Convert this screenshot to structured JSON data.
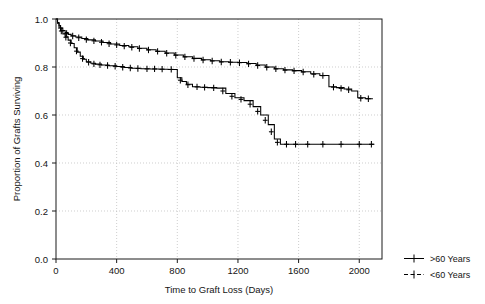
{
  "chart_data": {
    "type": "line",
    "title": "",
    "xlabel": "Time to Graft Loss (Days)",
    "ylabel": "Proportion of Grafts Surviving",
    "xlim": [
      0,
      2150
    ],
    "ylim": [
      0.0,
      1.0
    ],
    "xticks": [
      0,
      400,
      800,
      1200,
      1600,
      2000
    ],
    "xticklabels": [
      "0",
      "400",
      "800",
      "1200",
      "1600",
      "2000"
    ],
    "yticks": [
      0.0,
      0.2,
      0.4,
      0.6,
      0.8,
      1.0
    ],
    "yticklabels": [
      "0.0",
      "0.2",
      "0.4",
      "0.6",
      "0.8",
      "1.0"
    ],
    "grid": true,
    "legend_position": "right-outside",
    "style": "kaplan-meier step plot with plus-sign censoring marks",
    "series": [
      {
        "name": ">60 Years",
        "marker": "plus",
        "color": "#000000",
        "points": [
          [
            0,
            1.0
          ],
          [
            10,
            0.985
          ],
          [
            20,
            0.972
          ],
          [
            30,
            0.962
          ],
          [
            45,
            0.952
          ],
          [
            60,
            0.944
          ],
          [
            80,
            0.936
          ],
          [
            100,
            0.93
          ],
          [
            130,
            0.925
          ],
          [
            170,
            0.919
          ],
          [
            210,
            0.913
          ],
          [
            260,
            0.908
          ],
          [
            310,
            0.902
          ],
          [
            360,
            0.896
          ],
          [
            420,
            0.89
          ],
          [
            480,
            0.884
          ],
          [
            540,
            0.878
          ],
          [
            600,
            0.872
          ],
          [
            660,
            0.866
          ],
          [
            720,
            0.858
          ],
          [
            780,
            0.85
          ],
          [
            840,
            0.843
          ],
          [
            900,
            0.836
          ],
          [
            960,
            0.83
          ],
          [
            1020,
            0.826
          ],
          [
            1080,
            0.822
          ],
          [
            1140,
            0.82
          ],
          [
            1200,
            0.819
          ],
          [
            1260,
            0.815
          ],
          [
            1320,
            0.808
          ],
          [
            1380,
            0.8
          ],
          [
            1440,
            0.793
          ],
          [
            1500,
            0.788
          ],
          [
            1560,
            0.785
          ],
          [
            1620,
            0.78
          ],
          [
            1680,
            0.772
          ],
          [
            1740,
            0.765
          ],
          [
            1800,
            0.718
          ],
          [
            1850,
            0.714
          ],
          [
            1900,
            0.708
          ],
          [
            1950,
            0.7
          ],
          [
            1990,
            0.672
          ],
          [
            2040,
            0.668
          ],
          [
            2090,
            0.668
          ]
        ],
        "censor_marks": [
          [
            30,
            0.962
          ],
          [
            70,
            0.94
          ],
          [
            110,
            0.929
          ],
          [
            150,
            0.922
          ],
          [
            200,
            0.914
          ],
          [
            250,
            0.909
          ],
          [
            300,
            0.903
          ],
          [
            350,
            0.897
          ],
          [
            400,
            0.892
          ],
          [
            450,
            0.887
          ],
          [
            500,
            0.882
          ],
          [
            550,
            0.877
          ],
          [
            610,
            0.871
          ],
          [
            670,
            0.865
          ],
          [
            730,
            0.857
          ],
          [
            790,
            0.849
          ],
          [
            850,
            0.842
          ],
          [
            910,
            0.835
          ],
          [
            970,
            0.829
          ],
          [
            1030,
            0.825
          ],
          [
            1090,
            0.821
          ],
          [
            1150,
            0.82
          ],
          [
            1210,
            0.818
          ],
          [
            1270,
            0.813
          ],
          [
            1330,
            0.806
          ],
          [
            1390,
            0.799
          ],
          [
            1450,
            0.792
          ],
          [
            1510,
            0.787
          ],
          [
            1570,
            0.784
          ],
          [
            1630,
            0.779
          ],
          [
            1700,
            0.77
          ],
          [
            1760,
            0.764
          ],
          [
            1830,
            0.716
          ],
          [
            1880,
            0.711
          ],
          [
            1930,
            0.705
          ],
          [
            2010,
            0.67
          ],
          [
            2060,
            0.668
          ]
        ]
      },
      {
        "name": "<60 Years",
        "marker": "plus",
        "color": "#000000",
        "points": [
          [
            0,
            1.0
          ],
          [
            10,
            0.982
          ],
          [
            20,
            0.966
          ],
          [
            30,
            0.952
          ],
          [
            45,
            0.938
          ],
          [
            60,
            0.926
          ],
          [
            80,
            0.912
          ],
          [
            100,
            0.898
          ],
          [
            120,
            0.88
          ],
          [
            140,
            0.862
          ],
          [
            160,
            0.845
          ],
          [
            180,
            0.832
          ],
          [
            200,
            0.822
          ],
          [
            230,
            0.816
          ],
          [
            260,
            0.812
          ],
          [
            300,
            0.808
          ],
          [
            350,
            0.805
          ],
          [
            400,
            0.802
          ],
          [
            450,
            0.798
          ],
          [
            500,
            0.795
          ],
          [
            560,
            0.793
          ],
          [
            620,
            0.792
          ],
          [
            680,
            0.791
          ],
          [
            740,
            0.79
          ],
          [
            790,
            0.79
          ],
          [
            800,
            0.755
          ],
          [
            830,
            0.74
          ],
          [
            860,
            0.728
          ],
          [
            900,
            0.718
          ],
          [
            950,
            0.716
          ],
          [
            1000,
            0.714
          ],
          [
            1060,
            0.712
          ],
          [
            1120,
            0.69
          ],
          [
            1180,
            0.672
          ],
          [
            1240,
            0.66
          ],
          [
            1300,
            0.635
          ],
          [
            1350,
            0.6
          ],
          [
            1400,
            0.56
          ],
          [
            1440,
            0.5
          ],
          [
            1480,
            0.478
          ],
          [
            1540,
            0.478
          ],
          [
            1600,
            0.478
          ],
          [
            1700,
            0.478
          ],
          [
            1800,
            0.478
          ],
          [
            1900,
            0.478
          ],
          [
            2000,
            0.478
          ],
          [
            2100,
            0.478
          ]
        ],
        "censor_marks": [
          [
            35,
            0.95
          ],
          [
            65,
            0.924
          ],
          [
            95,
            0.9
          ],
          [
            135,
            0.866
          ],
          [
            175,
            0.835
          ],
          [
            215,
            0.82
          ],
          [
            250,
            0.813
          ],
          [
            290,
            0.809
          ],
          [
            340,
            0.806
          ],
          [
            390,
            0.803
          ],
          [
            440,
            0.799
          ],
          [
            490,
            0.796
          ],
          [
            540,
            0.794
          ],
          [
            600,
            0.792
          ],
          [
            650,
            0.792
          ],
          [
            700,
            0.791
          ],
          [
            760,
            0.79
          ],
          [
            820,
            0.745
          ],
          [
            870,
            0.726
          ],
          [
            930,
            0.717
          ],
          [
            980,
            0.715
          ],
          [
            1040,
            0.713
          ],
          [
            1100,
            0.7
          ],
          [
            1160,
            0.678
          ],
          [
            1220,
            0.665
          ],
          [
            1280,
            0.645
          ],
          [
            1330,
            0.615
          ],
          [
            1380,
            0.578
          ],
          [
            1420,
            0.53
          ],
          [
            1460,
            0.486
          ],
          [
            1520,
            0.478
          ],
          [
            1580,
            0.478
          ],
          [
            1660,
            0.478
          ],
          [
            1760,
            0.478
          ],
          [
            1880,
            0.478
          ],
          [
            2000,
            0.478
          ],
          [
            2080,
            0.478
          ]
        ]
      }
    ]
  },
  "legend": {
    "entries": [
      {
        "label": ">60 Years"
      },
      {
        "label": "<60 Years"
      }
    ]
  }
}
